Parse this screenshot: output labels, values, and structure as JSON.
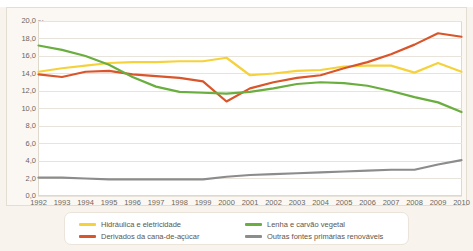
{
  "top_strip": {
    "clipped_text": ""
  },
  "axis_unit_label": "%",
  "legend": {
    "items": [
      {
        "label": "Hidráulica e eletricidade",
        "color": "#f5d23c",
        "key": "hidraulica"
      },
      {
        "label": "Derivados da cana-de-açúcar",
        "color": "#d9552a",
        "key": "cana"
      },
      {
        "label": "Lenha e carvão vegetal",
        "color": "#6aae3f",
        "key": "lenha"
      },
      {
        "label": "Outras fontes primárias renováveis",
        "color": "#8c8c8c",
        "key": "outras"
      }
    ]
  },
  "chart_data": {
    "type": "line",
    "title": "",
    "xlabel": "",
    "ylabel": "%",
    "ylim": [
      0.0,
      20.0
    ],
    "yticks": [
      "0,0",
      "2,0",
      "4,0",
      "6,0",
      "8,0",
      "10,0",
      "12,0",
      "14,0",
      "16,0",
      "18,0",
      "20,0"
    ],
    "ytick_values": [
      0,
      2,
      4,
      6,
      8,
      10,
      12,
      14,
      16,
      18,
      20
    ],
    "grid": true,
    "legend_position": "bottom",
    "x": [
      "1992",
      "1993",
      "1994",
      "1995",
      "1996",
      "1997",
      "1998",
      "1999",
      "2000",
      "2001",
      "2002",
      "2003",
      "2004",
      "2005",
      "2006",
      "2007",
      "2008",
      "2009",
      "2010"
    ],
    "series": [
      {
        "name": "Hidráulica e eletricidade",
        "color": "#f5d23c",
        "values": [
          14.2,
          14.6,
          14.9,
          15.2,
          15.3,
          15.3,
          15.4,
          15.4,
          15.8,
          13.8,
          14.0,
          14.3,
          14.4,
          14.8,
          14.9,
          14.9,
          14.1,
          15.2,
          14.2
        ]
      },
      {
        "name": "Derivados da cana-de-açúcar",
        "color": "#d9552a",
        "values": [
          13.9,
          13.6,
          14.2,
          14.3,
          13.9,
          13.7,
          13.5,
          13.1,
          10.8,
          12.3,
          13.0,
          13.5,
          13.8,
          14.6,
          15.3,
          16.2,
          17.3,
          18.6,
          18.2
        ]
      },
      {
        "name": "Lenha e carvão vegetal",
        "color": "#6aae3f",
        "values": [
          17.2,
          16.7,
          16.0,
          15.0,
          13.6,
          12.5,
          11.9,
          11.8,
          11.7,
          11.9,
          12.3,
          12.8,
          13.0,
          12.9,
          12.6,
          12.0,
          11.3,
          10.7,
          9.6
        ]
      },
      {
        "name": "Outras fontes primárias renováveis",
        "color": "#8c8c8c",
        "values": [
          2.1,
          2.1,
          2.0,
          1.9,
          1.9,
          1.9,
          1.9,
          1.9,
          2.2,
          2.4,
          2.5,
          2.6,
          2.7,
          2.8,
          2.9,
          3.0,
          3.0,
          3.6,
          4.1
        ]
      }
    ]
  }
}
